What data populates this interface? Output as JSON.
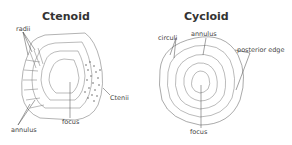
{
  "panels": [
    {
      "title": "Ctenoid",
      "labels": {
        "radii": "radii",
        "ctenii": "Ctenii",
        "focus": "focus",
        "annulus": "annulus"
      }
    },
    {
      "title": "Cycloid",
      "labels": {
        "circuli": "circuli",
        "annulus": "annulus",
        "posterior_edge": "posterior edge",
        "focus": "focus"
      }
    }
  ],
  "colors": {
    "ink": "#555555",
    "text": "#333333",
    "background": "#ffffff"
  }
}
